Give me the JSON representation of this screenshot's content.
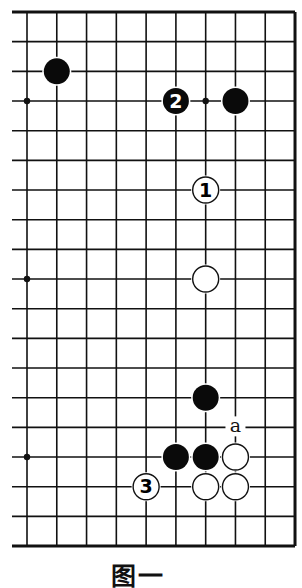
{
  "diagram": {
    "type": "go-board-partial",
    "caption": "图一",
    "grid": {
      "columns": 10,
      "rows": 19,
      "origin_x": 27,
      "origin_y": 12,
      "spacing_x": 29.78,
      "spacing_y": 29.67,
      "left_line_start_x": 12,
      "edges": [
        "top",
        "right",
        "bottom"
      ],
      "line_color": "#111111",
      "edge_width": 3,
      "line_width": 1.6
    },
    "star_points": [
      {
        "col": 0,
        "row": 3
      },
      {
        "col": 6,
        "row": 3
      },
      {
        "col": 0,
        "row": 9
      },
      {
        "col": 0,
        "row": 15
      }
    ],
    "stones": [
      {
        "color": "black",
        "col": 1,
        "row": 2,
        "label": ""
      },
      {
        "color": "black",
        "col": 5,
        "row": 3,
        "label": "2"
      },
      {
        "color": "black",
        "col": 7,
        "row": 3,
        "label": ""
      },
      {
        "color": "white",
        "col": 6,
        "row": 6,
        "label": "1"
      },
      {
        "color": "white",
        "col": 6,
        "row": 9,
        "label": ""
      },
      {
        "color": "black",
        "col": 6,
        "row": 13,
        "label": ""
      },
      {
        "color": "black",
        "col": 5,
        "row": 15,
        "label": ""
      },
      {
        "color": "black",
        "col": 6,
        "row": 15,
        "label": ""
      },
      {
        "color": "white",
        "col": 7,
        "row": 15,
        "label": ""
      },
      {
        "color": "white",
        "col": 4,
        "row": 16,
        "label": "3"
      },
      {
        "color": "white",
        "col": 6,
        "row": 16,
        "label": ""
      },
      {
        "color": "white",
        "col": 7,
        "row": 16,
        "label": ""
      }
    ],
    "markers": [
      {
        "col": 7,
        "row": 14,
        "label": "a"
      }
    ],
    "colors": {
      "black_stone": "#0a0a0a",
      "white_stone": "#ffffff",
      "stone_outline": "#111111",
      "background": "#ffffff"
    }
  }
}
